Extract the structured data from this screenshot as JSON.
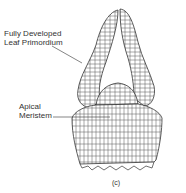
{
  "diagram": {
    "labels": {
      "leaf_primordium": [
        "Fully Developed",
        "Leaf Primordium"
      ],
      "apical_meristem": [
        "Apical",
        "Meristem"
      ]
    },
    "panel_label": "(c)",
    "line_color": "#333333"
  }
}
